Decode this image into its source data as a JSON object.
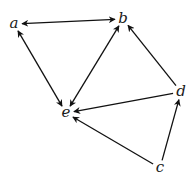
{
  "diagram": {
    "type": "directed-graph",
    "colors": {
      "edge": "#111111",
      "label": "#1a1a1a",
      "background": "#ffffff"
    },
    "nodes": [
      {
        "id": "a",
        "label": "a",
        "x": 14,
        "y": 24
      },
      {
        "id": "b",
        "label": "b",
        "x": 123,
        "y": 19
      },
      {
        "id": "d",
        "label": "d",
        "x": 181,
        "y": 92
      },
      {
        "id": "e",
        "label": "e",
        "x": 66,
        "y": 113
      },
      {
        "id": "c",
        "label": "c",
        "x": 160,
        "y": 168
      }
    ],
    "edges": [
      {
        "from": "a",
        "to": "b",
        "bidirectional": true
      },
      {
        "from": "a",
        "to": "e",
        "bidirectional": true
      },
      {
        "from": "b",
        "to": "e",
        "bidirectional": true
      },
      {
        "from": "d",
        "to": "b",
        "bidirectional": false
      },
      {
        "from": "d",
        "to": "e",
        "bidirectional": false
      },
      {
        "from": "c",
        "to": "e",
        "bidirectional": false
      },
      {
        "from": "c",
        "to": "d",
        "bidirectional": false
      }
    ]
  }
}
